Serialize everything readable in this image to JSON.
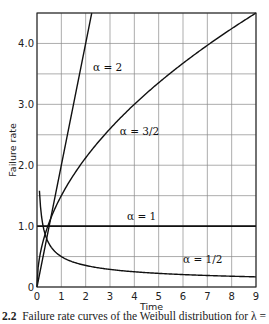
{
  "chart_data": {
    "type": "line",
    "title": "",
    "xlabel": "Time",
    "ylabel": "Failure rate",
    "xlim": [
      0,
      9
    ],
    "ylim": [
      0,
      4.5
    ],
    "x_ticks": [
      "0",
      "1",
      "2",
      "3",
      "4",
      "5",
      "6",
      "7",
      "8",
      "9"
    ],
    "y_ticks": [
      {
        "value": 0,
        "label": "0"
      },
      {
        "value": 1.0,
        "label": "1.0"
      },
      {
        "value": 2.0,
        "label": "2.0"
      },
      {
        "value": 3.0,
        "label": "3.0"
      },
      {
        "value": 4.0,
        "label": "4.0"
      }
    ],
    "grid": {
      "x_step": 1,
      "y_step": 0.5,
      "on": true
    },
    "legend": "inline curve labels",
    "series": [
      {
        "name": "α = 2",
        "formula": "2t",
        "x": [
          0,
          0.5,
          1,
          1.5,
          2,
          2.25
        ],
        "values": [
          0,
          1.0,
          2.0,
          3.0,
          4.0,
          4.5
        ]
      },
      {
        "name": "α = 3/2",
        "formula": "1.5·t^0.5",
        "x": [
          0,
          0.5,
          1,
          2,
          3,
          4,
          5,
          6,
          7,
          8,
          9
        ],
        "values": [
          0,
          1.06,
          1.5,
          2.12,
          2.6,
          3.0,
          3.35,
          3.67,
          3.97,
          4.24,
          4.5
        ]
      },
      {
        "name": "α = 1",
        "formula": "1",
        "x": [
          0,
          9
        ],
        "values": [
          1.0,
          1.0
        ]
      },
      {
        "name": "α = 1/2",
        "formula": "0.5·t^-0.5",
        "x": [
          0.1,
          0.25,
          0.5,
          1,
          2,
          3,
          4,
          5,
          6,
          7,
          8,
          9
        ],
        "values": [
          1.58,
          1.0,
          0.71,
          0.5,
          0.35,
          0.29,
          0.25,
          0.22,
          0.2,
          0.19,
          0.18,
          0.17
        ]
      }
    ],
    "annotations": [
      {
        "text": "α = 2",
        "x": 2.3,
        "y": 3.55
      },
      {
        "text": "α = 3/2",
        "x": 3.4,
        "y": 2.5
      },
      {
        "text": "α = 1",
        "x": 3.7,
        "y": 1.1
      },
      {
        "text": "α = 1/2",
        "x": 6.0,
        "y": 0.4
      }
    ]
  },
  "caption": {
    "figure_number": "2.2",
    "text": "Failure rate curves of the Weibull distribution for λ ="
  }
}
